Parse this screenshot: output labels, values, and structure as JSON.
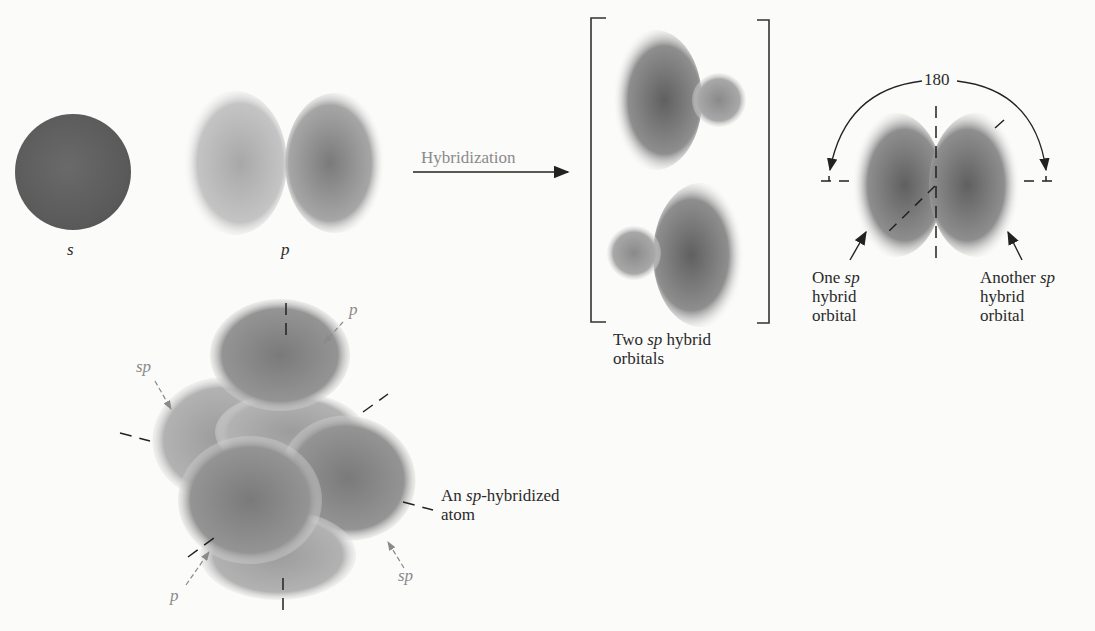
{
  "diagram": {
    "orbitals": {
      "s_label": "s",
      "p_label": "p"
    },
    "arrow": {
      "label": "Hybridization"
    },
    "hybrids": {
      "caption_prefix": "Two",
      "caption_italic": "sp",
      "caption_suffix": "hybrid",
      "caption_line2": "orbitals"
    },
    "angle": {
      "value": "180",
      "left_label_line1_prefix": "One",
      "left_label_line1_italic": "sp",
      "left_label_line2": "hybrid",
      "left_label_line3": "orbital",
      "right_label_line1_prefix": "Another",
      "right_label_line1_italic": "sp",
      "right_label_line2": "hybrid",
      "right_label_line3": "orbital"
    },
    "atom": {
      "label_prefix": "An",
      "label_italic": "sp",
      "label_suffix": "-hybridized",
      "label_line2": "atom",
      "p_top": "p",
      "sp_left": "sp",
      "p_bottom": "p",
      "sp_right": "sp"
    },
    "colors": {
      "orbital_dark": "#555555",
      "orbital_mid": "#888888",
      "line": "#222222",
      "grey_text": "#8a8a8a"
    }
  }
}
